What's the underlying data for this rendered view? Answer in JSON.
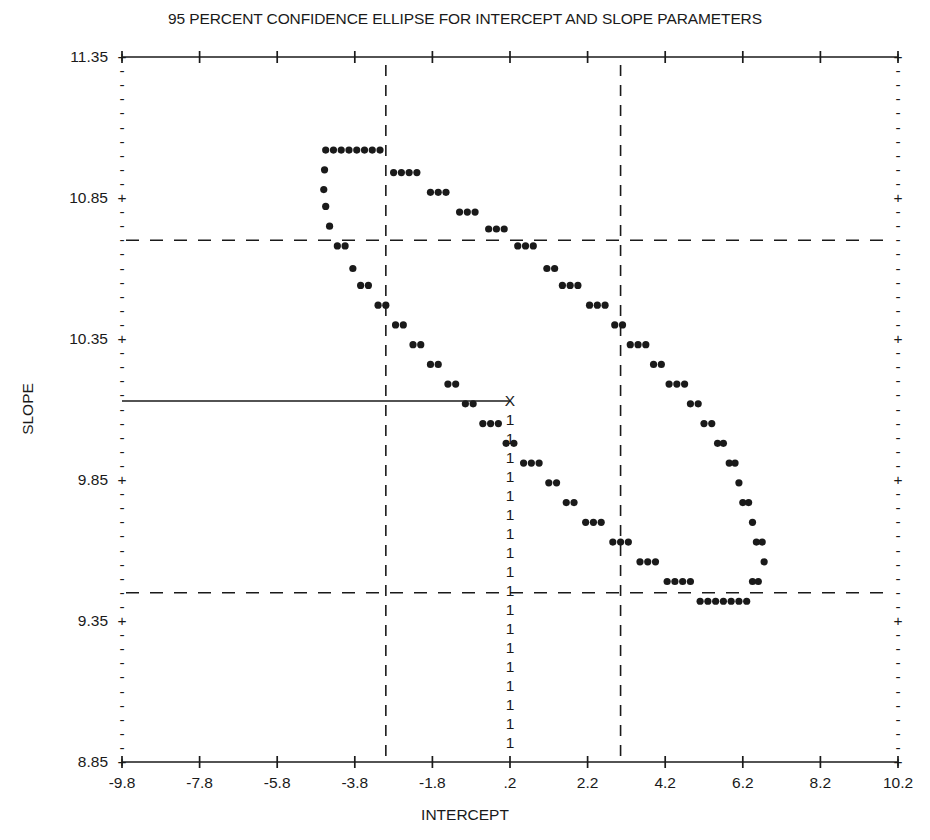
{
  "chart_data": {
    "type": "scatter",
    "title": "95 PERCENT CONFIDENCE ELLIPSE FOR INTERCEPT AND SLOPE PARAMETERS",
    "xlabel": "INTERCEPT",
    "ylabel": "SLOPE",
    "xlim": [
      -9.8,
      10.2
    ],
    "ylim": [
      8.85,
      11.35
    ],
    "grid": false,
    "legend": null,
    "xticks": [
      "-9.8",
      "-7.8",
      "-5.8",
      "-3.8",
      "-1.8",
      ".2",
      "2.2",
      "4.2",
      "6.2",
      "8.2",
      "10.2"
    ],
    "xtick_values": [
      -9.8,
      -7.8,
      -5.8,
      -3.8,
      -1.8,
      0.2,
      2.2,
      4.2,
      6.2,
      8.2,
      10.2
    ],
    "yticks": [
      "11.35",
      "10.85",
      "10.35",
      "9.85",
      "9.35",
      "8.85"
    ],
    "ytick_values": [
      11.35,
      10.85,
      10.35,
      9.85,
      9.35,
      8.85
    ],
    "minor_ticks_per_major_y": 9,
    "tick_major_glyph": "+",
    "tick_minor_glyph": "-",
    "center_marker": {
      "glyph": "X",
      "x": 0.2,
      "y": 10.13,
      "label": "estimated-parameter-point"
    },
    "reference_lines": {
      "vertical_dashed": [
        -3.0,
        3.05
      ],
      "horizontal_dashed": [
        10.7,
        9.45
      ],
      "vertical_solid_column_glyph": "1",
      "horizontal_solid": {
        "y": 10.13,
        "x_from": -9.8,
        "x_to": 0.2
      }
    },
    "series": [
      {
        "name": "confidence-ellipse-boundary",
        "marker": "filled-circle",
        "points_xy": [
          [
            -4.55,
            11.02
          ],
          [
            -4.35,
            11.02
          ],
          [
            -4.15,
            11.02
          ],
          [
            -3.95,
            11.02
          ],
          [
            -3.75,
            11.02
          ],
          [
            -3.55,
            11.02
          ],
          [
            -3.35,
            11.02
          ],
          [
            -3.15,
            11.02
          ],
          [
            -2.8,
            10.94
          ],
          [
            -2.6,
            10.94
          ],
          [
            -2.4,
            10.94
          ],
          [
            -2.2,
            10.94
          ],
          [
            -1.85,
            10.87
          ],
          [
            -1.65,
            10.87
          ],
          [
            -1.45,
            10.87
          ],
          [
            -1.1,
            10.8
          ],
          [
            -0.9,
            10.8
          ],
          [
            -0.7,
            10.8
          ],
          [
            -0.35,
            10.74
          ],
          [
            -0.15,
            10.74
          ],
          [
            0.05,
            10.74
          ],
          [
            0.4,
            10.68
          ],
          [
            0.6,
            10.68
          ],
          [
            0.8,
            10.68
          ],
          [
            1.15,
            10.6
          ],
          [
            1.35,
            10.6
          ],
          [
            1.55,
            10.54
          ],
          [
            1.75,
            10.54
          ],
          [
            1.95,
            10.54
          ],
          [
            2.25,
            10.47
          ],
          [
            2.45,
            10.47
          ],
          [
            2.65,
            10.47
          ],
          [
            2.9,
            10.4
          ],
          [
            3.1,
            10.4
          ],
          [
            3.3,
            10.33
          ],
          [
            3.5,
            10.33
          ],
          [
            3.7,
            10.33
          ],
          [
            3.9,
            10.26
          ],
          [
            4.1,
            10.26
          ],
          [
            4.3,
            10.19
          ],
          [
            4.5,
            10.19
          ],
          [
            4.7,
            10.19
          ],
          [
            4.85,
            10.12
          ],
          [
            5.05,
            10.12
          ],
          [
            5.2,
            10.05
          ],
          [
            5.4,
            10.05
          ],
          [
            5.55,
            9.98
          ],
          [
            5.7,
            9.98
          ],
          [
            5.85,
            9.91
          ],
          [
            6.0,
            9.91
          ],
          [
            6.1,
            9.84
          ],
          [
            6.2,
            9.77
          ],
          [
            6.35,
            9.77
          ],
          [
            6.45,
            9.7
          ],
          [
            6.55,
            9.63
          ],
          [
            6.7,
            9.63
          ],
          [
            6.75,
            9.56
          ],
          [
            6.6,
            9.49
          ],
          [
            6.45,
            9.49
          ],
          [
            6.3,
            9.42
          ],
          [
            6.1,
            9.42
          ],
          [
            5.9,
            9.42
          ],
          [
            5.7,
            9.42
          ],
          [
            5.5,
            9.42
          ],
          [
            5.3,
            9.42
          ],
          [
            5.1,
            9.42
          ],
          [
            4.85,
            9.49
          ],
          [
            4.65,
            9.49
          ],
          [
            4.45,
            9.49
          ],
          [
            4.25,
            9.49
          ],
          [
            3.95,
            9.56
          ],
          [
            3.75,
            9.56
          ],
          [
            3.55,
            9.56
          ],
          [
            3.25,
            9.63
          ],
          [
            3.05,
            9.63
          ],
          [
            2.85,
            9.63
          ],
          [
            2.55,
            9.7
          ],
          [
            2.35,
            9.7
          ],
          [
            2.15,
            9.7
          ],
          [
            1.85,
            9.77
          ],
          [
            1.65,
            9.77
          ],
          [
            1.4,
            9.84
          ],
          [
            1.2,
            9.84
          ],
          [
            0.95,
            9.91
          ],
          [
            0.75,
            9.91
          ],
          [
            0.55,
            9.91
          ],
          [
            0.3,
            9.98
          ],
          [
            0.1,
            9.98
          ],
          [
            -0.1,
            10.05
          ],
          [
            -0.3,
            10.05
          ],
          [
            -0.5,
            10.05
          ],
          [
            -0.75,
            10.12
          ],
          [
            -0.95,
            10.12
          ],
          [
            -1.2,
            10.19
          ],
          [
            -1.4,
            10.19
          ],
          [
            -1.65,
            10.26
          ],
          [
            -1.85,
            10.26
          ],
          [
            -2.1,
            10.33
          ],
          [
            -2.3,
            10.33
          ],
          [
            -2.55,
            10.4
          ],
          [
            -2.75,
            10.4
          ],
          [
            -3.0,
            10.47
          ],
          [
            -3.2,
            10.47
          ],
          [
            -3.45,
            10.54
          ],
          [
            -3.65,
            10.54
          ],
          [
            -3.85,
            10.6
          ],
          [
            -4.05,
            10.68
          ],
          [
            -4.25,
            10.68
          ],
          [
            -4.45,
            10.75
          ],
          [
            -4.55,
            10.82
          ],
          [
            -4.6,
            10.88
          ],
          [
            -4.58,
            10.95
          ]
        ]
      }
    ]
  }
}
